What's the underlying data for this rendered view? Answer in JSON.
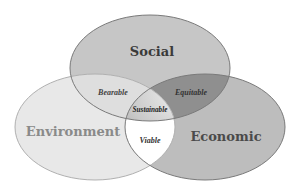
{
  "diagram": {
    "type": "venn",
    "sets": [
      {
        "id": "social",
        "label": "Social",
        "fill": "#c6c6c6",
        "text_color": "#3a3a3a"
      },
      {
        "id": "environment",
        "label": "Environment",
        "fill": "#e8e8e8",
        "text_color": "#8a8a8a"
      },
      {
        "id": "economic",
        "label": "Economic",
        "fill": "#bdbdbd",
        "text_color": "#4a4a4a"
      }
    ],
    "intersections": [
      {
        "id": "bearable",
        "sets": [
          "social",
          "environment"
        ],
        "label": "Bearable",
        "fill": "#dedede"
      },
      {
        "id": "equitable",
        "sets": [
          "social",
          "economic"
        ],
        "label": "Equitable",
        "fill": "#8f8f8f"
      },
      {
        "id": "viable",
        "sets": [
          "environment",
          "economic"
        ],
        "label": "Viable",
        "fill": "#ffffff"
      },
      {
        "id": "sustainable",
        "sets": [
          "social",
          "environment",
          "economic"
        ],
        "label": "Sustainable",
        "fill": "#bfbfbf"
      }
    ],
    "stroke_color": "#7a7a7a",
    "minor_text_color": "#333333"
  }
}
